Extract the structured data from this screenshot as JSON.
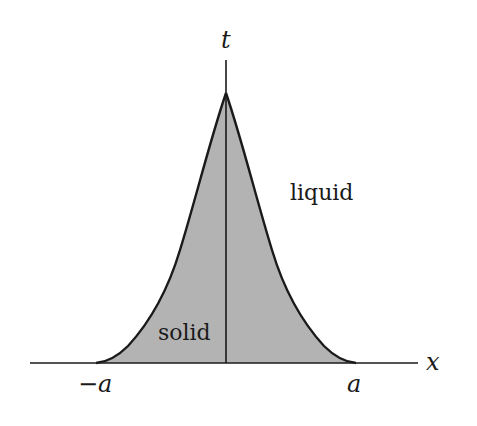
{
  "diagram": {
    "axes": {
      "x_label": "x",
      "t_label": "t",
      "left_tick": "−a",
      "right_tick": "a"
    },
    "regions": {
      "solid_label": "solid",
      "liquid_label": "liquid"
    },
    "colors": {
      "solid_fill": "#b3b3b3",
      "line": "#1a1a1a",
      "background": "#ffffff"
    }
  }
}
